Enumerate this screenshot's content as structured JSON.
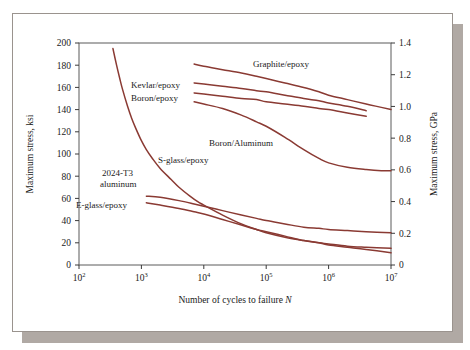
{
  "figure": {
    "background_color": "#ffffff",
    "border_color": "#9a938e",
    "shadow_color": "#b0a9a4",
    "curve_color": "#8a3a33",
    "axis_color": "#5a5a5a"
  },
  "chart_data": {
    "type": "line",
    "title": "",
    "xlabel_prefix": "Number of cycles to failure ",
    "xlabel_symbol": "N",
    "ylabel_left": "Maximum stress, ksi",
    "ylabel_right": "Maximum stress, GPa",
    "x_scale": "log",
    "xlim": [
      100,
      10000000
    ],
    "x_tick_base": "10",
    "x_tick_exponents": [
      "2",
      "3",
      "4",
      "5",
      "6",
      "7"
    ],
    "x_tick_values": [
      100,
      1000,
      10000,
      100000,
      1000000,
      10000000
    ],
    "ylim_left": [
      0,
      200
    ],
    "y_ticks_left": [
      0,
      20,
      40,
      60,
      80,
      100,
      120,
      140,
      160,
      180,
      200
    ],
    "ylim_right": [
      0,
      1.4
    ],
    "y_ticks_right": [
      "0",
      "0.2",
      "0.4",
      "0.6",
      "0.8",
      "1.0",
      "1.2",
      "1.4"
    ],
    "y_tick_values_right": [
      0,
      0.2,
      0.4,
      0.6,
      0.8,
      1.0,
      1.2,
      1.4
    ],
    "grid": false,
    "legend_position": "inline-annotations",
    "series": [
      {
        "name": "Graphite/epoxy",
        "label_x": 700000,
        "label_y": 185,
        "points": [
          [
            7000,
            181
          ],
          [
            10000,
            179
          ],
          [
            20000,
            176
          ],
          [
            40000,
            173
          ],
          [
            70000,
            170
          ],
          [
            100000,
            168
          ],
          [
            200000,
            164
          ],
          [
            400000,
            160
          ],
          [
            700000,
            156
          ],
          [
            1000000,
            153
          ],
          [
            2000000,
            149
          ],
          [
            4000000,
            145
          ],
          [
            7000000,
            142
          ],
          [
            10000000,
            140
          ]
        ]
      },
      {
        "name": "Kevlar/epoxy",
        "label_x": 2500,
        "label_y": 165,
        "points": [
          [
            7000,
            164
          ],
          [
            10000,
            163
          ],
          [
            20000,
            161
          ],
          [
            40000,
            159
          ],
          [
            70000,
            157
          ],
          [
            100000,
            156
          ],
          [
            200000,
            153
          ],
          [
            400000,
            150
          ],
          [
            700000,
            148
          ],
          [
            1000000,
            146
          ],
          [
            2000000,
            143
          ],
          [
            4000000,
            139
          ]
        ]
      },
      {
        "name": "Boron/epoxy",
        "label_x": 2500,
        "label_y": 155,
        "points": [
          [
            7000,
            155
          ],
          [
            10000,
            154
          ],
          [
            20000,
            152
          ],
          [
            40000,
            150
          ],
          [
            70000,
            149
          ],
          [
            100000,
            147
          ],
          [
            200000,
            145
          ],
          [
            400000,
            143
          ],
          [
            700000,
            141
          ],
          [
            1000000,
            140
          ],
          [
            2000000,
            137
          ],
          [
            4000000,
            134
          ]
        ]
      },
      {
        "name": "Boron/Aluminum",
        "label_x": 180000,
        "label_y": 112,
        "points": [
          [
            7000,
            147
          ],
          [
            10000,
            145
          ],
          [
            20000,
            141
          ],
          [
            40000,
            135
          ],
          [
            70000,
            129
          ],
          [
            100000,
            125
          ],
          [
            200000,
            115
          ],
          [
            400000,
            104
          ],
          [
            700000,
            96
          ],
          [
            1000000,
            92
          ],
          [
            2000000,
            88
          ],
          [
            4000000,
            86
          ],
          [
            7000000,
            85
          ],
          [
            10000000,
            85
          ]
        ]
      },
      {
        "name": "S-glass/epoxy",
        "label_x": 13000,
        "label_y": 86,
        "points": [
          [
            1200,
            62
          ],
          [
            2000,
            61
          ],
          [
            4000,
            58
          ],
          [
            7000,
            55
          ],
          [
            10000,
            53
          ],
          [
            20000,
            49
          ],
          [
            40000,
            45
          ],
          [
            70000,
            42
          ],
          [
            100000,
            40
          ],
          [
            200000,
            37
          ],
          [
            400000,
            34
          ],
          [
            700000,
            33
          ],
          [
            1000000,
            32
          ],
          [
            2000000,
            31
          ],
          [
            4000000,
            30
          ],
          [
            10000000,
            29
          ]
        ]
      },
      {
        "name": "2024-T3 aluminum",
        "label_x": 900,
        "label_y": 78,
        "points": [
          [
            350,
            195
          ],
          [
            400,
            180
          ],
          [
            450,
            168
          ],
          [
            500,
            158
          ],
          [
            600,
            143
          ],
          [
            700,
            132
          ],
          [
            800,
            124
          ],
          [
            1000,
            112
          ],
          [
            1200,
            104
          ],
          [
            1500,
            96
          ],
          [
            2000,
            87
          ],
          [
            3000,
            77
          ],
          [
            4000,
            70
          ],
          [
            6000,
            62
          ],
          [
            8000,
            57
          ],
          [
            10000,
            54
          ],
          [
            20000,
            45
          ],
          [
            40000,
            37
          ],
          [
            70000,
            32
          ],
          [
            100000,
            29
          ],
          [
            200000,
            25
          ],
          [
            400000,
            22
          ],
          [
            700000,
            20
          ],
          [
            1000000,
            19
          ],
          [
            2000000,
            17
          ],
          [
            4000000,
            16
          ],
          [
            10000000,
            15
          ]
        ]
      },
      {
        "name": "E-glass/epoxy",
        "label_x": 700,
        "label_y": 52,
        "points": [
          [
            1200,
            56
          ],
          [
            2000,
            54
          ],
          [
            4000,
            51
          ],
          [
            7000,
            48
          ],
          [
            10000,
            46
          ],
          [
            20000,
            41
          ],
          [
            40000,
            36
          ],
          [
            70000,
            32
          ],
          [
            100000,
            30
          ],
          [
            200000,
            26
          ],
          [
            400000,
            22
          ],
          [
            700000,
            20
          ],
          [
            1000000,
            18
          ],
          [
            2000000,
            16
          ],
          [
            4000000,
            14
          ],
          [
            10000000,
            11
          ]
        ]
      }
    ],
    "annotations": [
      {
        "text": "Graphite/epoxy",
        "x_px": 240,
        "y_px": 53,
        "anchor": "start"
      },
      {
        "text": "Kevlar/epoxy",
        "x_px": 118,
        "y_px": 74,
        "anchor": "start"
      },
      {
        "text": "Boron/epoxy",
        "x_px": 118,
        "y_px": 87,
        "anchor": "start"
      },
      {
        "text": "Boron/Aluminum",
        "x_px": 196,
        "y_px": 132,
        "anchor": "start"
      },
      {
        "text": "S-glass/epoxy",
        "x_px": 145,
        "y_px": 149,
        "anchor": "start"
      },
      {
        "text": "2024-T3",
        "x_px": 89,
        "y_px": 162,
        "anchor": "start"
      },
      {
        "text": "aluminum",
        "x_px": 87,
        "y_px": 173,
        "anchor": "start"
      },
      {
        "text": "E-glass/epoxy",
        "x_px": 63,
        "y_px": 194,
        "anchor": "start"
      }
    ]
  }
}
